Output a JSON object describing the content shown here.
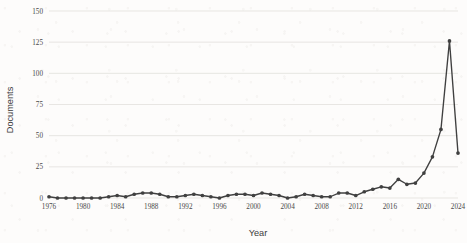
{
  "chart_data": {
    "type": "line",
    "title": "",
    "xlabel": "Year",
    "ylabel": "Documents",
    "xlim": [
      1976,
      2024
    ],
    "ylim": [
      0,
      150
    ],
    "grid": "horizontal",
    "legend": "none",
    "x_tick_labels": [
      "1976",
      "1980",
      "1984",
      "1988",
      "1992",
      "1996",
      "2000",
      "2004",
      "2008",
      "2012",
      "2016",
      "2020",
      "2024"
    ],
    "y_tick_labels": [
      "0",
      "25",
      "50",
      "75",
      "100",
      "125",
      "150"
    ],
    "x_ticks": [
      1976,
      1980,
      1984,
      1988,
      1992,
      1996,
      2000,
      2004,
      2008,
      2012,
      2016,
      2020,
      2024
    ],
    "y_ticks": [
      0,
      25,
      50,
      75,
      100,
      125,
      150
    ],
    "series": [
      {
        "name": "Documents",
        "color": "#404040",
        "marker": "circle",
        "x": [
          1976,
          1977,
          1978,
          1979,
          1980,
          1981,
          1982,
          1983,
          1984,
          1985,
          1986,
          1987,
          1988,
          1989,
          1990,
          1991,
          1992,
          1993,
          1994,
          1995,
          1996,
          1997,
          1998,
          1999,
          2000,
          2001,
          2002,
          2003,
          2004,
          2005,
          2006,
          2007,
          2008,
          2009,
          2010,
          2011,
          2012,
          2013,
          2014,
          2015,
          2016,
          2017,
          2018,
          2019,
          2020,
          2021,
          2022,
          2023,
          2024
        ],
        "values": [
          1,
          0,
          0,
          0,
          0,
          0,
          0,
          1,
          2,
          1,
          3,
          4,
          4,
          3,
          1,
          1,
          2,
          3,
          2,
          1,
          0,
          2,
          3,
          3,
          2,
          4,
          3,
          2,
          0,
          1,
          3,
          2,
          1,
          1,
          4,
          4,
          2,
          5,
          7,
          9,
          8,
          15,
          11,
          12,
          20,
          33,
          55,
          126,
          36
        ]
      }
    ]
  },
  "axis_titles": {
    "x": "Year",
    "y": "Documents"
  }
}
